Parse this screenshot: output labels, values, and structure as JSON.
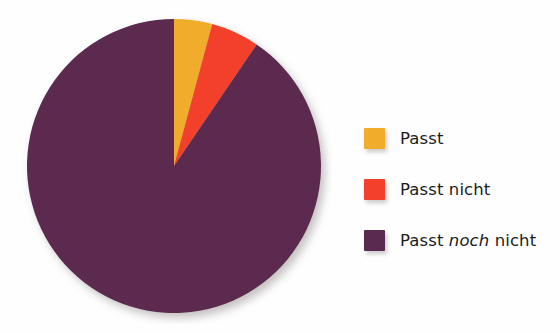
{
  "figure": {
    "background_color": "#fefefe",
    "shadow_color": "rgba(120,110,110,0.35)"
  },
  "chart_data": {
    "type": "pie",
    "title": "",
    "subtitle": "",
    "xlabel": "",
    "ylabel": "",
    "grid": false,
    "legend_position": "right",
    "start_angle_deg": 0,
    "direction": "clockwise",
    "center_px": [
      174,
      167
    ],
    "radius_px": 143,
    "labels": [
      "Passt",
      "Passt nicht",
      "Passt noch nicht"
    ],
    "values": [
      4.2,
      5.3,
      90.5
    ],
    "angles_deg": [
      15.1,
      19.1,
      325.8
    ],
    "colors": [
      "#f0ac2a",
      "#f2402b",
      "#5b2a50"
    ],
    "slices": [
      {
        "label": "Passt",
        "value": 4.2,
        "angle_deg": 15.1,
        "color": "#f0ac2a"
      },
      {
        "label": "Passt nicht",
        "value": 5.3,
        "angle_deg": 19.1,
        "color": "#f2402b"
      },
      {
        "label": "Passt noch nicht",
        "value": 90.5,
        "angle_deg": 325.8,
        "color": "#5b2a50"
      }
    ]
  },
  "legend": {
    "items": [
      {
        "swatch_color": "#f0ac2a",
        "label_pre": "Passt",
        "label_em": "",
        "label_post": "",
        "label_full": "Passt"
      },
      {
        "swatch_color": "#f2402b",
        "label_pre": "Passt nicht",
        "label_em": "",
        "label_post": "",
        "label_full": "Passt nicht"
      },
      {
        "swatch_color": "#5b2a50",
        "label_pre": "Passt ",
        "label_em": "noch",
        "label_post": " nicht",
        "label_full": "Passt noch nicht"
      }
    ]
  }
}
